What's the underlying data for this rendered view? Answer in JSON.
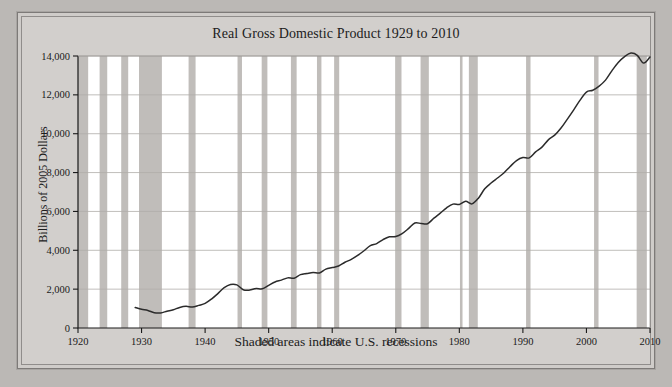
{
  "figure": {
    "title": "Real Gross Domestic Product 1929 to 2010",
    "ylabel": "Billions of 2005 Dollars",
    "xcaption": "Shaded areas indicate U.S. recessions"
  },
  "chart_data": {
    "type": "line",
    "title": "Real Gross Domestic Product 1929 to 2010",
    "xlabel": "",
    "ylabel": "Billions of 2005 Dollars",
    "xlim": [
      1920,
      2010
    ],
    "ylim": [
      0,
      14000
    ],
    "xticks": [
      1920,
      1930,
      1940,
      1950,
      1960,
      1970,
      1980,
      1990,
      2000,
      2010
    ],
    "yticks": [
      0,
      2000,
      4000,
      6000,
      8000,
      10000,
      12000,
      14000
    ],
    "ytick_labels": [
      "0",
      "2,000",
      "4,000",
      "6,000",
      "8,000",
      "10,000",
      "12,000",
      "14,000"
    ],
    "xtick_labels": [
      "1920",
      "1930",
      "1940",
      "1950",
      "1960",
      "1970",
      "1980",
      "1990",
      "2000",
      "2010"
    ],
    "grid": true,
    "legend": null,
    "annotation": "Shaded areas indicate U.S. recessions",
    "series": [
      {
        "name": "Real GDP",
        "color": "#2b2b2b",
        "x": [
          1929,
          1930,
          1931,
          1932,
          1933,
          1934,
          1935,
          1936,
          1937,
          1938,
          1939,
          1940,
          1941,
          1942,
          1943,
          1944,
          1945,
          1946,
          1947,
          1948,
          1949,
          1950,
          1951,
          1952,
          1953,
          1954,
          1955,
          1956,
          1957,
          1958,
          1959,
          1960,
          1961,
          1962,
          1963,
          1964,
          1965,
          1966,
          1967,
          1968,
          1969,
          1970,
          1971,
          1972,
          1973,
          1974,
          1975,
          1976,
          1977,
          1978,
          1979,
          1980,
          1981,
          1982,
          1983,
          1984,
          1985,
          1986,
          1987,
          1988,
          1989,
          1990,
          1991,
          1992,
          1993,
          1994,
          1995,
          1996,
          1997,
          1998,
          1999,
          2000,
          2001,
          2002,
          2003,
          2004,
          2005,
          2006,
          2007,
          2008,
          2009,
          2010
        ],
        "y": [
          1057,
          966,
          904,
          788,
          778,
          862,
          939,
          1060,
          1114,
          1078,
          1164,
          1266,
          1490,
          1772,
          2074,
          2240,
          2218,
          1971,
          1950,
          2031,
          2018,
          2194,
          2370,
          2465,
          2580,
          2565,
          2746,
          2805,
          2857,
          2835,
          3031,
          3109,
          3189,
          3384,
          3532,
          3735,
          3976,
          4236,
          4345,
          4553,
          4695,
          4706,
          4858,
          5114,
          5405,
          5378,
          5369,
          5655,
          5913,
          6184,
          6377,
          6360,
          6518,
          6389,
          6681,
          7164,
          7461,
          7719,
          7980,
          8313,
          8616,
          8773,
          8756,
          9063,
          9309,
          9684,
          9925,
          10293,
          10754,
          11230,
          11728,
          12144,
          12236,
          12449,
          12758,
          13237,
          13668,
          13970,
          14148,
          14032,
          13635,
          13950
        ]
      }
    ],
    "recession_bands": [
      {
        "start": 1920.0,
        "end": 1921.6
      },
      {
        "start": 1923.4,
        "end": 1924.6
      },
      {
        "start": 1926.8,
        "end": 1927.9
      },
      {
        "start": 1929.6,
        "end": 1933.2
      },
      {
        "start": 1937.4,
        "end": 1938.5
      },
      {
        "start": 1945.1,
        "end": 1945.8
      },
      {
        "start": 1948.9,
        "end": 1949.8
      },
      {
        "start": 1953.5,
        "end": 1954.4
      },
      {
        "start": 1957.6,
        "end": 1958.3
      },
      {
        "start": 1960.3,
        "end": 1961.1
      },
      {
        "start": 1969.9,
        "end": 1970.9
      },
      {
        "start": 1973.9,
        "end": 1975.2
      },
      {
        "start": 1980.1,
        "end": 1980.5
      },
      {
        "start": 1981.5,
        "end": 1982.9
      },
      {
        "start": 1990.5,
        "end": 1991.2
      },
      {
        "start": 2001.2,
        "end": 2001.9
      },
      {
        "start": 2007.9,
        "end": 2009.5
      }
    ]
  }
}
